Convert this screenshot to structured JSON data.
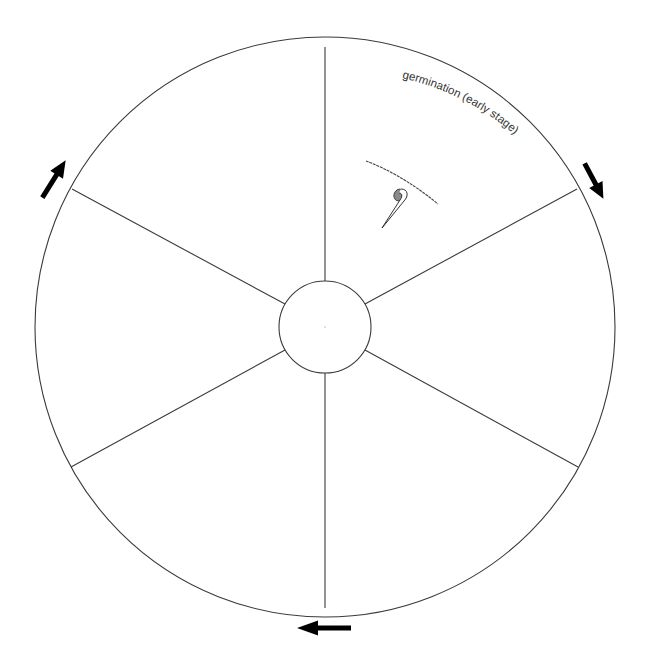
{
  "diagram": {
    "title": "",
    "type": "cycle-wheel",
    "segment_count": 6,
    "colors": {
      "line": "#3a3a3a",
      "arrow": "#000000",
      "label": "#333333",
      "seed_fill": "#8a8a8a"
    },
    "segments": [
      {
        "position": "top-right",
        "label": "germination (early stage)",
        "illustration": "seedling-emerging-below-soil-line"
      },
      {
        "position": "right",
        "label": "",
        "illustration": ""
      },
      {
        "position": "bottom-right",
        "label": "",
        "illustration": ""
      },
      {
        "position": "bottom-left",
        "label": "",
        "illustration": ""
      },
      {
        "position": "left",
        "label": "",
        "illustration": ""
      },
      {
        "position": "top-left",
        "label": "",
        "illustration": ""
      }
    ],
    "direction_arrows": [
      {
        "position": "top-right",
        "direction": "clockwise",
        "icon": "arrow-down-right-icon"
      },
      {
        "position": "bottom",
        "direction": "clockwise",
        "icon": "arrow-left-icon"
      },
      {
        "position": "top-left",
        "direction": "clockwise",
        "icon": "arrow-up-right-icon"
      }
    ],
    "center": {
      "label": ""
    }
  }
}
